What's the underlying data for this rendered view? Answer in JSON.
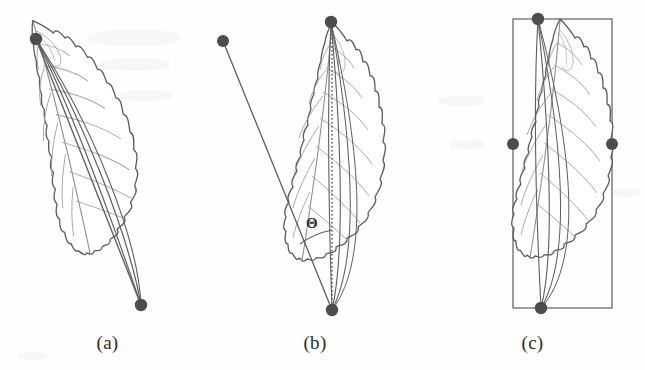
{
  "figure": {
    "background_color": "#fefefe",
    "ink_color": "#4a4a4a",
    "vein_color": "#9a9a9a",
    "marker_color": "#4d4d4d",
    "box_color": "#555555"
  },
  "panels": [
    {
      "id": "a",
      "caption": "(a)",
      "description": "leaf with tip and base landmark points connected by straight chords",
      "markers": [
        {
          "name": "leaf-tip-point",
          "x": 36,
          "y": 39
        },
        {
          "name": "leaf-base-point",
          "x": 141,
          "y": 305
        }
      ],
      "has_axis_line": false,
      "has_bounding_box": false,
      "has_angle": false
    },
    {
      "id": "b",
      "caption": "(b)",
      "description": "leaf with vertical dotted major axis, an oblique reference line from an external point to the leaf base, and the angle theta between them",
      "markers": [
        {
          "name": "external-reference-point",
          "x": 223,
          "y": 41
        },
        {
          "name": "leaf-tip-point",
          "x": 331,
          "y": 22
        },
        {
          "name": "leaf-base-point",
          "x": 332,
          "y": 310
        }
      ],
      "has_axis_line": true,
      "has_bounding_box": false,
      "has_angle": true,
      "angle_symbol": "Θ",
      "angle_label_position": {
        "x": 311,
        "y": 222
      }
    },
    {
      "id": "c",
      "caption": "(c)",
      "description": "leaf inscribed in its axis-aligned bounding box with four extremal landmark points",
      "markers": [
        {
          "name": "leaf-tip-point",
          "x": 538,
          "y": 19
        },
        {
          "name": "left-extremum-point",
          "x": 513,
          "y": 144
        },
        {
          "name": "right-extremum-point",
          "x": 612,
          "y": 144
        },
        {
          "name": "leaf-base-point",
          "x": 541,
          "y": 308
        }
      ],
      "has_axis_line": false,
      "has_bounding_box": true,
      "bounding_box": {
        "x": 513,
        "y": 19,
        "width": 99,
        "height": 289
      },
      "has_angle": false
    }
  ]
}
